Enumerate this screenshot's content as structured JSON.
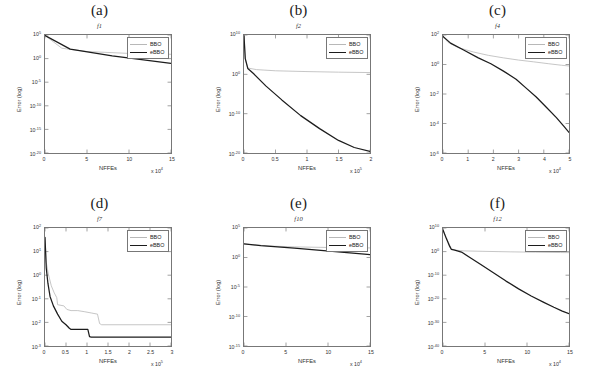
{
  "figure": {
    "series_names": [
      "BBO",
      "eBBO"
    ],
    "colors": {
      "bbo": "#b8b8b8",
      "ebbo": "#1c1c1c",
      "axis": "#777777",
      "text": "#333333"
    },
    "axis_labels": {
      "x": "NFFEs",
      "y": "Error (log)"
    }
  },
  "chart_data": [
    {
      "type": "line",
      "panel": "(a)",
      "title": "(a)",
      "subtitle": "f1",
      "xlabel": "NFFEs",
      "ylabel": "Error (log)",
      "yscale": "log",
      "ylim": [
        1e-20,
        100000.0
      ],
      "xlim": [
        0,
        150000
      ],
      "x_multiplier": "x 10",
      "x_multiplier_exp": "4",
      "xticks": [
        0,
        5,
        10,
        15
      ],
      "xticklabels": [
        "0",
        "5",
        "10",
        "15"
      ],
      "yticks": [
        100000.0,
        1.0,
        1e-05,
        1e-10,
        1e-15,
        1e-20
      ],
      "yticklabels": [
        "10",
        "10",
        "10",
        "10",
        "10",
        "10"
      ],
      "ytickexps": [
        "5",
        "0",
        "-5",
        "-10",
        "-15",
        "-20"
      ],
      "grid": false,
      "legend_position": "top-right",
      "series": [
        {
          "name": "BBO",
          "color": "#b8b8b8",
          "x": [
            0,
            2,
            5,
            10,
            18,
            28,
            40,
            55,
            72,
            90,
            110,
            130,
            150
          ],
          "y_exp": [
            4.9,
            2.2,
            1.5,
            1.1,
            0.8,
            0.6,
            0.45,
            0.32,
            0.22,
            0.15,
            0.1,
            0.05,
            0.0
          ]
        },
        {
          "name": "eBBO",
          "color": "#1c1c1c",
          "x": [
            0,
            3,
            8,
            15,
            25,
            38,
            52,
            66,
            80,
            95,
            110,
            125,
            140,
            150
          ],
          "y_exp": [
            4.9,
            2.0,
            0.6,
            -1.0,
            -3.2,
            -5.5,
            -7.6,
            -9.6,
            -11.6,
            -13.6,
            -15.3,
            -17.0,
            -18.4,
            -19.2
          ]
        }
      ]
    },
    {
      "type": "line",
      "panel": "(b)",
      "title": "(b)",
      "subtitle": "f2",
      "xlabel": "NFFEs",
      "ylabel": "Error (log)",
      "yscale": "log",
      "ylim": [
        1e-20,
        10000000000.0
      ],
      "xlim": [
        0,
        200000
      ],
      "x_multiplier": "x 10",
      "x_multiplier_exp": "5",
      "xticks": [
        0,
        0.5,
        1,
        1.5,
        2
      ],
      "xticklabels": [
        "0",
        "0.5",
        "1",
        "1.5",
        "2"
      ],
      "yticks": [
        10000000000.0,
        1.0,
        1e-10,
        1e-20
      ],
      "yticklabels": [
        "10",
        "10",
        "10",
        "10"
      ],
      "ytickexps": [
        "10",
        "0",
        "-10",
        "-20"
      ],
      "grid": false,
      "legend_position": "top-right",
      "series": [
        {
          "name": "BBO",
          "color": "#b8b8b8",
          "x": [
            0,
            0.02,
            0.06,
            0.2,
            0.5,
            1.0,
            1.5,
            2.0
          ],
          "y_exp": [
            9.8,
            4.0,
            1.6,
            1.2,
            0.9,
            0.7,
            0.55,
            0.45
          ]
        },
        {
          "name": "eBBO",
          "color": "#1c1c1c",
          "x": [
            0,
            0.02,
            0.06,
            0.15,
            0.35,
            0.6,
            0.9,
            1.2,
            1.5,
            1.75,
            2.0
          ],
          "y_exp": [
            9.8,
            4.0,
            1.5,
            0.2,
            -3.0,
            -6.5,
            -10.5,
            -13.8,
            -16.8,
            -18.6,
            -19.6
          ]
        }
      ]
    },
    {
      "type": "line",
      "panel": "(c)",
      "title": "(c)",
      "subtitle": "f4",
      "xlabel": "NFFEs",
      "ylabel": "Error (log)",
      "yscale": "log",
      "ylim": [
        1e-06,
        100.0
      ],
      "xlim": [
        0,
        50000
      ],
      "x_multiplier": "x 10",
      "x_multiplier_exp": "4",
      "xticks": [
        0,
        1,
        2,
        3,
        4,
        5
      ],
      "xticklabels": [
        "0",
        "1",
        "2",
        "3",
        "4",
        "5"
      ],
      "yticks": [
        100.0,
        1.0,
        0.01,
        0.0001,
        1e-06
      ],
      "yticklabels": [
        "10",
        "10",
        "10",
        "10",
        "10"
      ],
      "ytickexps": [
        "2",
        "0",
        "-2",
        "-4",
        "-6"
      ],
      "grid": false,
      "legend_position": "top-right",
      "series": [
        {
          "name": "BBO",
          "color": "#b8b8b8",
          "x": [
            0,
            0.2,
            0.6,
            1.2,
            1.8,
            2.4,
            3.0,
            3.6,
            4.2,
            4.7,
            5.0
          ],
          "y_exp": [
            1.9,
            1.5,
            1.15,
            0.85,
            0.62,
            0.45,
            0.3,
            0.18,
            0.05,
            -0.05,
            -0.1
          ]
        },
        {
          "name": "eBBO",
          "color": "#1c1c1c",
          "x": [
            0,
            0.3,
            0.8,
            1.4,
            1.9,
            2.4,
            2.9,
            3.3,
            3.7,
            4.1,
            4.5,
            4.8,
            5.0
          ],
          "y_exp": [
            1.9,
            1.45,
            1.0,
            0.45,
            0.05,
            -0.45,
            -1.0,
            -1.6,
            -2.2,
            -2.9,
            -3.6,
            -4.2,
            -4.6
          ]
        }
      ]
    },
    {
      "type": "line",
      "panel": "(d)",
      "title": "(d)",
      "subtitle": "f7",
      "xlabel": "NFFEs",
      "ylabel": "Error (log)",
      "yscale": "log",
      "ylim": [
        0.001,
        100.0
      ],
      "xlim": [
        0,
        300000
      ],
      "x_multiplier": "x 10",
      "x_multiplier_exp": "5",
      "xticks": [
        0,
        0.5,
        1,
        1.5,
        2,
        2.5,
        3
      ],
      "xticklabels": [
        "0",
        "0.5",
        "1",
        "1.5",
        "2",
        "2.5",
        "3"
      ],
      "yticks": [
        100.0,
        10.0,
        1.0,
        0.1,
        0.01,
        0.001
      ],
      "yticklabels": [
        "10",
        "10",
        "10",
        "10",
        "10",
        "10"
      ],
      "ytickexps": [
        "2",
        "1",
        "0",
        "-1",
        "-2",
        "-3"
      ],
      "grid": false,
      "legend_position": "top-right",
      "series": [
        {
          "name": "BBO",
          "color": "#b8b8b8",
          "x": [
            0,
            0.03,
            0.08,
            0.15,
            0.22,
            0.28,
            0.3,
            0.45,
            0.52,
            0.62,
            0.78,
            0.95,
            1.1,
            1.25,
            1.3,
            1.35,
            3.0
          ],
          "y_exp": [
            1.6,
            0.55,
            0.05,
            -0.45,
            -0.75,
            -0.95,
            -1.25,
            -1.3,
            -1.45,
            -1.5,
            -1.5,
            -1.55,
            -1.6,
            -1.65,
            -2.05,
            -2.1,
            -2.1
          ]
        },
        {
          "name": "eBBO",
          "color": "#1c1c1c",
          "x": [
            0,
            0.03,
            0.07,
            0.12,
            0.2,
            0.3,
            0.4,
            0.5,
            0.58,
            0.62,
            1.02,
            1.06,
            1.1,
            3.0
          ],
          "y_exp": [
            1.6,
            0.3,
            -0.35,
            -0.9,
            -1.3,
            -1.65,
            -1.95,
            -2.1,
            -2.25,
            -2.3,
            -2.3,
            -2.6,
            -2.62,
            -2.62
          ]
        }
      ]
    },
    {
      "type": "line",
      "panel": "(e)",
      "title": "(e)",
      "subtitle": "f10",
      "xlabel": "NFFEs",
      "ylabel": "Error (log)",
      "yscale": "log",
      "ylim": [
        1e-15,
        100000.0
      ],
      "xlim": [
        0,
        150000
      ],
      "x_multiplier": "x 10",
      "x_multiplier_exp": "4",
      "xticks": [
        0,
        5,
        10,
        15
      ],
      "xticklabels": [
        "0",
        "5",
        "10",
        "15"
      ],
      "yticks": [
        100000.0,
        1.0,
        1e-05,
        1e-10,
        1e-15
      ],
      "yticklabels": [
        "10",
        "10",
        "10",
        "10",
        "10"
      ],
      "ytickexps": [
        "5",
        "0",
        "-5",
        "-10",
        "-15"
      ],
      "grid": false,
      "legend_position": "top-right",
      "series": [
        {
          "name": "BBO",
          "color": "#b8b8b8",
          "x": [
            0,
            1,
            3,
            6,
            10,
            20,
            40,
            60,
            90,
            120,
            150
          ],
          "y_exp": [
            2.3,
            2.15,
            1.95,
            1.8,
            1.7,
            1.55,
            1.4,
            1.3,
            1.2,
            1.1,
            1.0
          ]
        },
        {
          "name": "eBBO",
          "color": "#1c1c1c",
          "x": [
            0,
            2,
            6,
            14,
            25,
            40,
            55,
            70,
            90,
            110,
            130,
            145,
            150
          ],
          "y_exp": [
            2.3,
            2.0,
            1.6,
            0.6,
            -0.7,
            -2.3,
            -3.7,
            -5.0,
            -6.7,
            -8.2,
            -9.4,
            -10.2,
            -10.4
          ]
        }
      ]
    },
    {
      "type": "line",
      "panel": "(f)",
      "title": "(f)",
      "subtitle": "f12",
      "xlabel": "NFFEs",
      "ylabel": "Error (log)",
      "yscale": "log",
      "ylim": [
        1e-40,
        10000000000.0
      ],
      "xlim": [
        0,
        150000
      ],
      "x_multiplier": "x 10",
      "x_multiplier_exp": "4",
      "xticks": [
        0,
        5,
        10,
        15
      ],
      "xticklabels": [
        "0",
        "5",
        "10",
        "15"
      ],
      "yticks": [
        10000000000.0,
        1.0,
        1e-10,
        1e-20,
        1e-30,
        1e-40
      ],
      "yticklabels": [
        "10",
        "10",
        "10",
        "10",
        "10",
        "10"
      ],
      "ytickexps": [
        "10",
        "0",
        "-10",
        "-20",
        "-30",
        "-40"
      ],
      "grid": false,
      "legend_position": "top-right",
      "series": [
        {
          "name": "BBO",
          "color": "#b8b8b8",
          "x": [
            0,
            0.5,
            1.0,
            1.5,
            2.5,
            5,
            8,
            11,
            14,
            15
          ],
          "y_exp": [
            9.2,
            5.0,
            1.2,
            0.6,
            0.3,
            0.1,
            -0.1,
            -0.25,
            -0.4,
            -0.45
          ]
        },
        {
          "name": "eBBO",
          "color": "#1c1c1c",
          "x": [
            0,
            0.4,
            0.8,
            1.0,
            1.4,
            2.2,
            3.2,
            4.5,
            6,
            7.5,
            9,
            10.5,
            12,
            13.2,
            14.2,
            15
          ],
          "y_exp": [
            9.2,
            5.5,
            2.2,
            0.9,
            0.6,
            -0.2,
            -2.5,
            -5.5,
            -9.0,
            -12.5,
            -15.8,
            -18.8,
            -21.5,
            -23.6,
            -25.2,
            -26.3
          ]
        }
      ]
    }
  ]
}
